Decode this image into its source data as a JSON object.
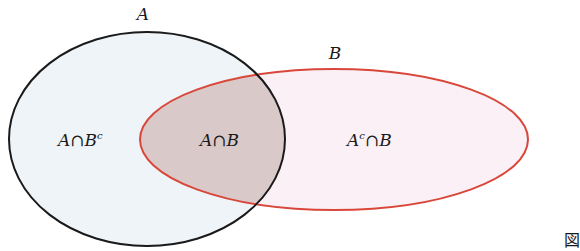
{
  "diagram": {
    "type": "venn",
    "sets": [
      {
        "id": "A",
        "label": "A",
        "shape": {
          "cx": 147,
          "cy": 139,
          "rx": 138,
          "ry": 107
        },
        "stroke": "#1a1a1a",
        "fill": "#eef4f8"
      },
      {
        "id": "B",
        "label": "B",
        "shape": {
          "cx": 334,
          "cy": 139.5,
          "rx": 194,
          "ry": 70.5
        },
        "stroke": "#d9473a",
        "fill": "#faf0f6"
      }
    ],
    "overlap_fill": "#d9c9c8",
    "regions": [
      {
        "id": "A-only",
        "base": "A",
        "op": "∩",
        "rhs": "B",
        "sup": "c",
        "sup_on": "rhs"
      },
      {
        "id": "intersection",
        "base": "A",
        "op": "∩",
        "rhs": "B",
        "sup": "",
        "sup_on": ""
      },
      {
        "id": "B-only",
        "base": "A",
        "op": "∩",
        "rhs": "B",
        "sup": "c",
        "sup_on": "base"
      }
    ],
    "labels": {
      "set_a": "A",
      "set_b": "B",
      "region_a_only_base": "A",
      "region_a_only_op": "∩",
      "region_a_only_rhs": "B",
      "region_a_only_sup": "c",
      "region_intersection_base": "A",
      "region_intersection_op": "∩",
      "region_intersection_rhs": "B",
      "region_b_only_base": "A",
      "region_b_only_sup": "c",
      "region_b_only_op": "∩",
      "region_b_only_rhs": "B"
    }
  },
  "figure_label": "図"
}
